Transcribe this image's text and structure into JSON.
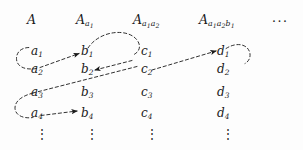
{
  "figure": {
    "type": "indexed-array-tree-diagram",
    "ink_color": "#1a1a1a",
    "background_color": "#fdfdfd",
    "headers": [
      {
        "base": "A",
        "sub": ""
      },
      {
        "base": "A",
        "sub": "a1"
      },
      {
        "base": "A",
        "sub": "a1a2"
      },
      {
        "base": "A",
        "sub": "a1a2b1"
      }
    ],
    "header_ellipsis": "···",
    "columns": [
      {
        "name": "column-a",
        "entries": [
          "a1",
          "a2",
          "a3",
          "a4"
        ],
        "ellipsis": "⋮"
      },
      {
        "name": "column-b",
        "entries": [
          "b1",
          "b2",
          "b3",
          "b4"
        ],
        "ellipsis": "⋮"
      },
      {
        "name": "column-c",
        "entries": [
          "c1",
          "c2",
          "c3",
          "c4"
        ],
        "ellipsis": "⋮"
      },
      {
        "name": "column-d",
        "entries": [
          "d1",
          "d2",
          "d3",
          "d4"
        ],
        "ellipsis": "⋮"
      }
    ],
    "entry_letters": {
      "a": "a",
      "b": "b",
      "c": "c",
      "d": "d"
    },
    "subscripts": [
      "1",
      "2",
      "3",
      "4"
    ],
    "arrows": [
      {
        "name": "loop-a2-to-a1",
        "style": "dashed-curve",
        "from": "a2",
        "to": "a1"
      },
      {
        "name": "arrow-a2-to-b1",
        "style": "dashed-diagonal-arrow",
        "from": "a2",
        "to": "b1"
      },
      {
        "name": "loop-b1-to-c1",
        "style": "dashed-arc",
        "from": "b1",
        "to": "c1"
      },
      {
        "name": "arrow-c2-to-b2",
        "style": "dashed-diagonal-arrow",
        "from": "c2",
        "to": "b2"
      },
      {
        "name": "arrow-c2-to-d1",
        "style": "dashed-diagonal-arrow",
        "from": "c2",
        "to": "d1"
      },
      {
        "name": "loop-d1-right",
        "style": "dashed-arc",
        "from": "d1",
        "to": "d1-right"
      },
      {
        "name": "arrow-a4-to-b4",
        "style": "dashed-diagonal-arrow",
        "from": "a4",
        "to": "b4"
      },
      {
        "name": "loop-a3-to-a4",
        "style": "dashed-curve",
        "from": "a3",
        "to": "a4"
      }
    ]
  }
}
